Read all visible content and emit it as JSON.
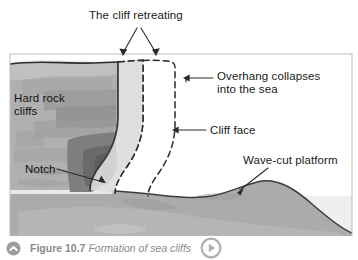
{
  "figure": {
    "panel_bg": "#b4b4b4",
    "sea_color": "#ededed",
    "caption": {
      "figure_number": "Figure 10.7",
      "title": "Formation of sea cliffs",
      "collapse_icon": "chevron-up-circle-icon",
      "play_icon": "play-circle-icon",
      "color": "#8a8a8a"
    },
    "labels": [
      {
        "id": "cliff-retreating",
        "text": "The cliff retreating",
        "lines": [
          "The cliff retreating"
        ]
      },
      {
        "id": "overhang",
        "text": "Overhang collapses into the sea",
        "lines": [
          "Overhang collapses",
          "into the sea"
        ]
      },
      {
        "id": "cliff-face",
        "text": "Cliff face",
        "lines": [
          "Cliff face"
        ]
      },
      {
        "id": "hard-rock",
        "text": "Hard rock cliffs",
        "lines": [
          "Hard rock",
          "cliffs"
        ]
      },
      {
        "id": "notch",
        "text": "Notch",
        "lines": [
          "Notch"
        ]
      },
      {
        "id": "wave-cut",
        "text": "Wave-cut platform",
        "lines": [
          "Wave-cut platform"
        ]
      }
    ],
    "annotations": {
      "cliff_retreating_arrows": 2,
      "dashed_outlines": 2
    }
  }
}
